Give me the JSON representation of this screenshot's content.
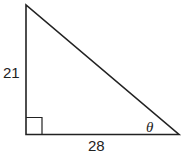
{
  "diagram": {
    "type": "right-triangle",
    "vertical_leg_label": "21",
    "horizontal_leg_label": "28",
    "angle_label": "θ",
    "right_angle_marker": true,
    "stroke_color": "#222222"
  }
}
